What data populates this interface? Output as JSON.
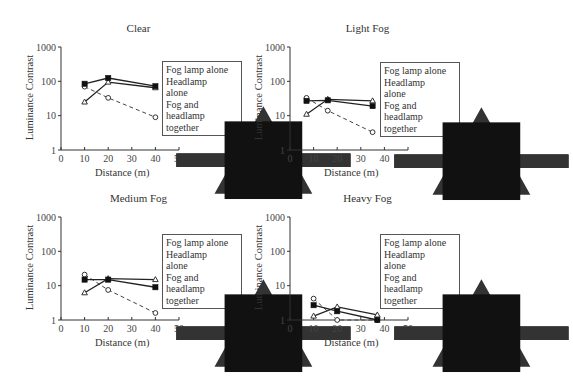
{
  "legend": {
    "items": [
      {
        "label": "Fog lamp alone",
        "marker": "circle-open",
        "dash": true
      },
      {
        "label": "Headlamp\nalone",
        "marker": "triangle-open",
        "dash": false
      },
      {
        "label": "Fog and\nheadlamp\ntogether",
        "marker": "square-filled",
        "dash": false
      }
    ]
  },
  "axes": {
    "ylabel": "Luminance Contrast",
    "xlabel": "Distance (m)",
    "yticks": [
      "1",
      "10",
      "100",
      "1000"
    ],
    "xticks": [
      "0",
      "10",
      "20",
      "30",
      "40",
      "50"
    ]
  },
  "panels": [
    {
      "title": "Clear"
    },
    {
      "title": "Light Fog"
    },
    {
      "title": "Medium Fog"
    },
    {
      "title": "Heavy Fog"
    }
  ],
  "chart_data": [
    {
      "type": "line",
      "title": "Clear",
      "xlabel": "Distance (m)",
      "ylabel": "Luminance Contrast",
      "xlim": [
        0,
        50
      ],
      "ylim": [
        1,
        1000
      ],
      "yscale": "log",
      "grid": false,
      "legend_position": "right",
      "series": [
        {
          "name": "Fog lamp alone",
          "x": [
            10,
            20,
            40
          ],
          "values": [
            70,
            33,
            9
          ],
          "style": "dashed",
          "marker": "open-circle"
        },
        {
          "name": "Headlamp alone",
          "x": [
            10,
            20,
            40
          ],
          "values": [
            25,
            95,
            65
          ],
          "style": "solid",
          "marker": "open-triangle"
        },
        {
          "name": "Fog and headlamp together",
          "x": [
            10,
            20,
            40
          ],
          "values": [
            85,
            125,
            72
          ],
          "style": "solid",
          "marker": "filled-square"
        }
      ]
    },
    {
      "type": "line",
      "title": "Light Fog",
      "xlabel": "Distance (m)",
      "ylabel": "Luminance Contrast",
      "xlim": [
        0,
        50
      ],
      "ylim": [
        1,
        1000
      ],
      "yscale": "log",
      "grid": false,
      "legend_position": "right",
      "series": [
        {
          "name": "Fog lamp alone",
          "x": [
            7,
            16,
            35
          ],
          "values": [
            33,
            14,
            3.3
          ],
          "style": "dashed",
          "marker": "open-circle"
        },
        {
          "name": "Headlamp alone",
          "x": [
            7,
            16,
            35
          ],
          "values": [
            11,
            30,
            27
          ],
          "style": "solid",
          "marker": "open-triangle"
        },
        {
          "name": "Fog and headlamp together",
          "x": [
            7,
            16,
            35
          ],
          "values": [
            27,
            28,
            19
          ],
          "style": "solid",
          "marker": "filled-square"
        }
      ]
    },
    {
      "type": "line",
      "title": "Medium Fog",
      "xlabel": "Distance (m)",
      "ylabel": "Luminance Contrast",
      "xlim": [
        0,
        50
      ],
      "ylim": [
        1,
        1000
      ],
      "yscale": "log",
      "grid": false,
      "legend_position": "right",
      "series": [
        {
          "name": "Fog lamp alone",
          "x": [
            10,
            20,
            40
          ],
          "values": [
            21,
            7.5,
            1.6
          ],
          "style": "dashed",
          "marker": "open-circle"
        },
        {
          "name": "Headlamp alone",
          "x": [
            10,
            20,
            40
          ],
          "values": [
            6.2,
            16,
            15
          ],
          "style": "solid",
          "marker": "open-triangle"
        },
        {
          "name": "Fog and headlamp together",
          "x": [
            10,
            20,
            40
          ],
          "values": [
            15,
            15,
            9
          ],
          "style": "solid",
          "marker": "filled-square"
        }
      ]
    },
    {
      "type": "line",
      "title": "Heavy Fog",
      "xlabel": "Distance (m)",
      "ylabel": "Luminance Contrast",
      "xlim": [
        0,
        50
      ],
      "ylim": [
        1,
        1000
      ],
      "yscale": "log",
      "grid": false,
      "legend_position": "right",
      "series": [
        {
          "name": "Fog lamp alone",
          "x": [
            10,
            20,
            37
          ],
          "values": [
            4.2,
            1.0,
            1.0
          ],
          "style": "dashed",
          "marker": "open-circle"
        },
        {
          "name": "Headlamp alone",
          "x": [
            10,
            20,
            37
          ],
          "values": [
            1.3,
            2.4,
            1.4
          ],
          "style": "solid",
          "marker": "open-triangle"
        },
        {
          "name": "Fog and headlamp together",
          "x": [
            10,
            20,
            37
          ],
          "values": [
            2.7,
            1.8,
            1.0
          ],
          "style": "solid",
          "marker": "filled-square"
        }
      ]
    }
  ]
}
